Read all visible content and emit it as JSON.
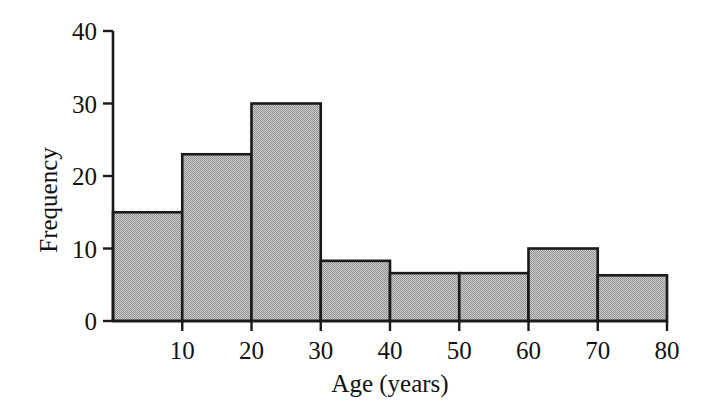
{
  "chart_data": {
    "type": "bar",
    "title": "",
    "subtitle": "",
    "xlabel": "Age (years)",
    "ylabel": "Frequency",
    "xlim": [
      0,
      80
    ],
    "ylim": [
      0,
      40
    ],
    "grid": false,
    "legend": null,
    "bin_width": 10,
    "categories": [
      "0-10",
      "10-20",
      "20-30",
      "30-40",
      "40-50",
      "50-60",
      "60-70",
      "70-80"
    ],
    "bin_edges": [
      0,
      10,
      20,
      30,
      40,
      50,
      60,
      70,
      80
    ],
    "values": [
      15,
      23,
      30,
      8.3,
      6.6,
      6.6,
      10,
      6.3
    ],
    "x_tick_labels": [
      "10",
      "20",
      "30",
      "40",
      "50",
      "60",
      "70",
      "80"
    ],
    "x_tick_values": [
      10,
      20,
      30,
      40,
      50,
      60,
      70,
      80
    ],
    "y_tick_labels": [
      "0",
      "10",
      "20",
      "30",
      "40"
    ],
    "y_tick_values": [
      0,
      10,
      20,
      30,
      40
    ],
    "colors": {
      "bar_fill": "#b4b4b4",
      "bar_stroke": "#1a1a1a",
      "axis": "#1a1a1a",
      "background": "#ffffff",
      "text": "#111111"
    }
  }
}
